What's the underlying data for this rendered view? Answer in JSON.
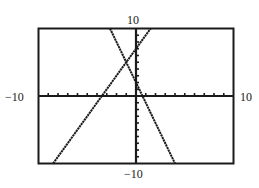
{
  "chart_data": {
    "type": "line",
    "title": "",
    "xlabel": "",
    "ylabel": "",
    "xlim": [
      -10,
      10
    ],
    "ylim": [
      -10,
      10
    ],
    "xscale_ticks": 1,
    "yscale_ticks": 1,
    "grid": false,
    "legend": null,
    "window_labels": {
      "xmin": "-10",
      "xmax": "10",
      "ymin": "-10",
      "ymax": "10"
    },
    "series": [
      {
        "name": "y = 2x + 7",
        "slope": 2,
        "intercept": 7,
        "x": [
          -8.5,
          1.5
        ],
        "y": [
          -10,
          10
        ]
      },
      {
        "name": "y = -3x + 2",
        "slope": -3,
        "intercept": 2,
        "x": [
          -2.667,
          4
        ],
        "y": [
          10,
          -10
        ]
      }
    ],
    "intersection": {
      "x": -1,
      "y": 5
    },
    "line_color": "#1a1a1a",
    "frame_color": "#1a1a1a"
  },
  "labels": {
    "ymax": "10",
    "ymin": "−10",
    "xmin": "−10",
    "xmax": "10"
  }
}
